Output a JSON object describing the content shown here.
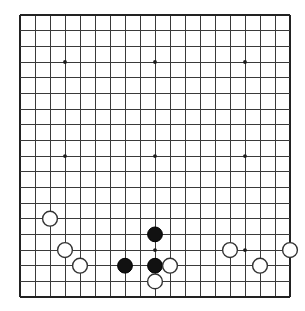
{
  "board": {
    "kind": "go-board",
    "size": 19,
    "columns": 19,
    "rows": 19,
    "origin_x": 20,
    "origin_y": 15,
    "spacing_x": 15.0,
    "spacing_y": 15.67,
    "line_color": "#3a3a3a",
    "edge_color": "#222222",
    "background_color": "#ffffff",
    "star_radius": 1.9,
    "stone_radius": 7.4,
    "star_points": [
      {
        "col": 4,
        "row": 4
      },
      {
        "col": 10,
        "row": 4
      },
      {
        "col": 16,
        "row": 4
      },
      {
        "col": 4,
        "row": 10
      },
      {
        "col": 10,
        "row": 10
      },
      {
        "col": 16,
        "row": 10
      },
      {
        "col": 4,
        "row": 16
      },
      {
        "col": 10,
        "row": 16
      },
      {
        "col": 16,
        "row": 16
      }
    ],
    "stones": [
      {
        "color": "white",
        "col": 3,
        "row": 14,
        "label": "white-stone-c14"
      },
      {
        "color": "white",
        "col": 4,
        "row": 16,
        "label": "white-stone-d16"
      },
      {
        "color": "white",
        "col": 5,
        "row": 17,
        "label": "white-stone-e17"
      },
      {
        "color": "black",
        "col": 8,
        "row": 17,
        "label": "black-stone-h17"
      },
      {
        "color": "black",
        "col": 10,
        "row": 15,
        "label": "black-stone-j15"
      },
      {
        "color": "black",
        "col": 10,
        "row": 17,
        "label": "black-stone-j17"
      },
      {
        "color": "white",
        "col": 11,
        "row": 17,
        "label": "white-stone-k17"
      },
      {
        "color": "white",
        "col": 10,
        "row": 18,
        "label": "white-stone-j18"
      },
      {
        "color": "white",
        "col": 15,
        "row": 16,
        "label": "white-stone-p16"
      },
      {
        "color": "white",
        "col": 17,
        "row": 17,
        "label": "white-stone-r17"
      },
      {
        "color": "white",
        "col": 19,
        "row": 16,
        "label": "white-stone-t16"
      }
    ],
    "black_stone_count": 3,
    "white_stone_count": 8,
    "caption": ""
  }
}
